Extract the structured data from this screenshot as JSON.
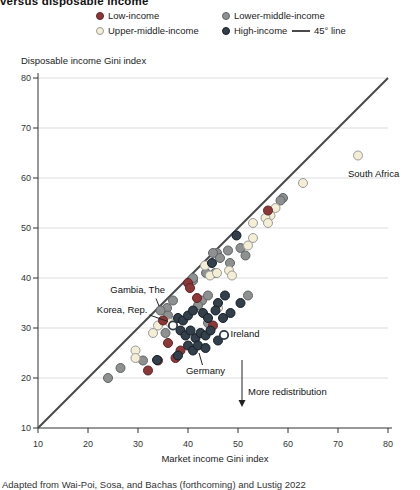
{
  "figure": {
    "title_partial": "versus disposable income",
    "source_partial": "Adapted from Wai-Poi, Sosa, and Bachas (forthcoming) and Lustig 2022"
  },
  "legend": {
    "items": [
      {
        "label": "Low-income",
        "fill": "#8c3839",
        "stroke": "#5f2427"
      },
      {
        "label": "Lower-middle-income",
        "fill": "#8f9191",
        "stroke": "#5d6466"
      },
      {
        "label": "Upper-middle-income",
        "fill": "#f4eed6",
        "stroke": "#9a9a9a"
      },
      {
        "label": "High-income",
        "fill": "#333f4a",
        "stroke": "#161e26"
      }
    ],
    "line_item": {
      "label": "45° line",
      "color": "#4a4a4a"
    }
  },
  "chart_data": {
    "type": "scatter",
    "xlabel": "Market income Gini index",
    "ylabel": "Disposable income Gini index",
    "xlim": [
      10,
      80
    ],
    "ylim": [
      10,
      80
    ],
    "x_ticks": [
      10,
      20,
      30,
      40,
      50,
      60,
      70,
      80
    ],
    "y_ticks": [
      10,
      20,
      30,
      40,
      50,
      60,
      70,
      80
    ],
    "grid": "horizontal",
    "gridline_color": "#dddddd",
    "diagonal": {
      "label": "45° line",
      "from": [
        10,
        10
      ],
      "to": [
        80,
        80
      ],
      "color": "#47484a"
    },
    "series": [
      {
        "name": "Lower-middle-income",
        "fill": "#8f9191",
        "stroke": "#5d6466",
        "points": [
          [
            59,
            56
          ],
          [
            58.5,
            55.5
          ],
          [
            50.5,
            46
          ],
          [
            48,
            45.5
          ],
          [
            51.5,
            44.5
          ],
          [
            45.8,
            45
          ],
          [
            46.4,
            44
          ],
          [
            48.4,
            43
          ],
          [
            45.4,
            41
          ],
          [
            43.6,
            41
          ],
          [
            41,
            39.5
          ],
          [
            42.8,
            35.5
          ],
          [
            45,
            45
          ],
          [
            41,
            40
          ],
          [
            37,
            35.5
          ],
          [
            35.8,
            34
          ],
          [
            44,
            36.5
          ],
          [
            34.5,
            33.5
          ],
          [
            36,
            32.5
          ],
          [
            42,
            34.5
          ],
          [
            52,
            36.5
          ],
          [
            35.5,
            29
          ],
          [
            44,
            31
          ],
          [
            31,
            23.5
          ],
          [
            24,
            20
          ],
          [
            26.5,
            22
          ]
        ]
      },
      {
        "name": "Upper-middle-income",
        "fill": "#f4eed6",
        "stroke": "#9a9a9a",
        "points": [
          [
            74,
            64.5
          ],
          [
            63,
            59
          ],
          [
            57.5,
            54
          ],
          [
            56.5,
            52.5
          ],
          [
            55.5,
            52
          ],
          [
            53,
            51
          ],
          [
            56,
            51
          ],
          [
            53,
            48
          ],
          [
            52,
            46.5
          ],
          [
            48.2,
            41.5
          ],
          [
            48.8,
            40.5
          ],
          [
            44.4,
            40.5
          ],
          [
            45.8,
            41
          ],
          [
            43.4,
            42.5
          ],
          [
            46,
            34
          ],
          [
            36.5,
            31
          ],
          [
            33,
            29
          ],
          [
            34,
            30.5
          ],
          [
            29.5,
            25.5
          ],
          [
            29.5,
            24
          ]
        ]
      },
      {
        "name": "Low-income",
        "fill": "#8c3839",
        "stroke": "#5f2427",
        "points": [
          [
            56,
            53.5
          ],
          [
            40,
            39
          ],
          [
            40.4,
            38
          ],
          [
            41.8,
            36
          ],
          [
            35,
            31.5
          ],
          [
            36,
            27
          ],
          [
            37.5,
            24
          ],
          [
            34,
            23.5
          ],
          [
            32,
            21.5
          ],
          [
            45,
            30.5
          ],
          [
            38.5,
            25.5
          ]
        ]
      },
      {
        "name": "High-income",
        "fill": "#333f4a",
        "stroke": "#161e26",
        "points": [
          [
            49.7,
            48.5
          ],
          [
            44.8,
            43
          ],
          [
            47.4,
            36.5
          ],
          [
            46,
            35
          ],
          [
            38,
            32
          ],
          [
            39,
            31.5
          ],
          [
            40,
            32.5
          ],
          [
            41,
            33.5
          ],
          [
            43,
            33
          ],
          [
            44,
            32
          ],
          [
            45.5,
            33.5
          ],
          [
            47,
            32
          ],
          [
            48.5,
            33
          ],
          [
            50.5,
            35
          ],
          [
            38.5,
            29.5
          ],
          [
            39.5,
            28.5
          ],
          [
            40.5,
            29.5
          ],
          [
            41.5,
            28
          ],
          [
            42.5,
            29
          ],
          [
            43.5,
            28.5
          ],
          [
            44.5,
            29.5
          ],
          [
            40,
            26.5
          ],
          [
            41,
            25.5
          ],
          [
            42,
            26.5
          ],
          [
            43.5,
            26
          ],
          [
            46,
            27.5
          ],
          [
            38,
            24.5
          ],
          [
            33.8,
            23.6
          ]
        ]
      },
      {
        "name": "Highlighted-country",
        "fill": "#ffffff",
        "stroke": "#2f3a44",
        "stroke_width": 1.8,
        "r": 4.2,
        "points": [
          [
            37,
            30.5
          ],
          [
            47.2,
            28.6
          ]
        ]
      }
    ],
    "annotations": [
      {
        "id": "south-africa",
        "label": "South Africa",
        "text_at": [
          72,
          60.2
        ],
        "anchor": "start"
      },
      {
        "id": "gambia",
        "label": "Gambia, The",
        "text_at": [
          35.4,
          37.0
        ],
        "anchor": "end",
        "line": [
          [
            33.6,
            35.9
          ],
          [
            34.2,
            34.4
          ]
        ]
      },
      {
        "id": "korea",
        "label": "Korea, Rep.",
        "text_at": [
          31.9,
          33.0
        ],
        "anchor": "end",
        "line": [
          [
            32.3,
            32.6
          ],
          [
            36.0,
            31.3
          ]
        ]
      },
      {
        "id": "ireland",
        "label": "Ireland",
        "text_at": [
          48.5,
          28.2
        ],
        "anchor": "start"
      },
      {
        "id": "germany",
        "label": "Germany",
        "text_at": [
          43.5,
          20.9
        ],
        "anchor": "middle",
        "line": [
          [
            42.9,
            22.6
          ],
          [
            42.2,
            25.0
          ]
        ]
      },
      {
        "id": "more-redistribution",
        "label": "More redistribution",
        "text_at": [
          52.0,
          16.6
        ],
        "anchor": "start",
        "arrow": [
          [
            50.8,
            23.6
          ],
          [
            50.8,
            14.2
          ]
        ]
      }
    ]
  }
}
